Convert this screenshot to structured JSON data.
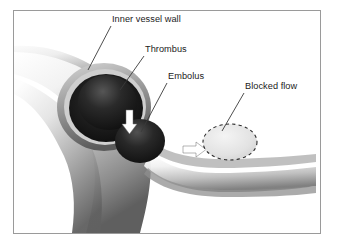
{
  "figure": {
    "type": "medical-illustration",
    "frame_border_color": "#9a9a9a",
    "background_color": "#ffffff"
  },
  "labels": [
    {
      "id": "inner-vessel-wall",
      "text": "Inner vessel wall",
      "text_x": 112,
      "text_y": 22,
      "leader": {
        "x1": 111,
        "y1": 26,
        "x2": 88,
        "y2": 70
      }
    },
    {
      "id": "thrombus",
      "text": "Thrombus",
      "text_x": 145,
      "text_y": 52,
      "leader": {
        "x1": 144,
        "y1": 56,
        "x2": 120,
        "y2": 90
      }
    },
    {
      "id": "embolus",
      "text": "Embolus",
      "text_x": 168,
      "text_y": 79,
      "leader": {
        "x1": 167,
        "y1": 83,
        "x2": 141,
        "y2": 132
      }
    },
    {
      "id": "blocked-flow",
      "text": "Blocked flow",
      "text_x": 245,
      "text_y": 89,
      "leader": {
        "x1": 244,
        "y1": 93,
        "x2": 222,
        "y2": 131
      }
    }
  ],
  "structures": {
    "vessel": {
      "name": "blood vessel",
      "wall_tone": "#8e8e8e"
    },
    "thrombus": {
      "name": "thrombus",
      "fill": "#1c1c1c"
    },
    "embolus": {
      "name": "embolus",
      "fill": "#1e1e1e"
    },
    "blocked_flow_region": {
      "name": "blocked flow region",
      "outline_style": "dashed",
      "outline_color": "#2b2b2b"
    },
    "arrows": [
      {
        "id": "thrombus-detach-arrow",
        "direction": "down",
        "color": "#ffffff"
      },
      {
        "id": "embolus-travel-arrow",
        "direction": "right",
        "color": "#ffffff"
      }
    ]
  },
  "colors": {
    "ink": "#1b1b1b",
    "leader_line": "#3a3a3a",
    "frame": "#9a9a9a",
    "vessel_light": "#e9e9e9",
    "vessel_mid": "#a8a8a8",
    "vessel_dark": "#4a4a4a",
    "lumen_dark": "#141414"
  }
}
